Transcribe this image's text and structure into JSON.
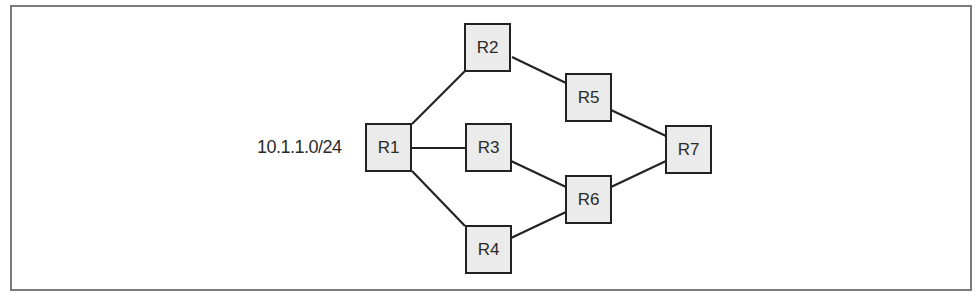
{
  "diagram": {
    "type": "network-topology",
    "network_label": "10.1.1.0/24",
    "colors": {
      "node_fill": "#ebebeb",
      "node_border": "#222222",
      "link": "#222222",
      "frame": "#7a7a7a"
    },
    "nodes": [
      {
        "id": "R1",
        "label": "R1"
      },
      {
        "id": "R2",
        "label": "R2"
      },
      {
        "id": "R3",
        "label": "R3"
      },
      {
        "id": "R4",
        "label": "R4"
      },
      {
        "id": "R5",
        "label": "R5"
      },
      {
        "id": "R6",
        "label": "R6"
      },
      {
        "id": "R7",
        "label": "R7"
      }
    ],
    "links": [
      [
        "R1",
        "R2"
      ],
      [
        "R1",
        "R3"
      ],
      [
        "R1",
        "R4"
      ],
      [
        "R2",
        "R5"
      ],
      [
        "R3",
        "R6"
      ],
      [
        "R4",
        "R6"
      ],
      [
        "R5",
        "R7"
      ],
      [
        "R6",
        "R7"
      ]
    ]
  }
}
